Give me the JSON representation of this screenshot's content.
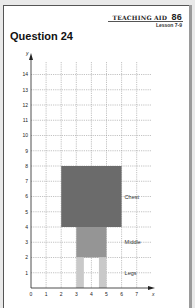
{
  "header": {
    "title": "Teaching Aid",
    "number": "86",
    "lesson": "Lesson 7-9"
  },
  "question": {
    "title": "Question 24"
  },
  "chart_data": {
    "type": "diagram",
    "title": "Question 24",
    "xlabel": "x",
    "ylabel": "y",
    "xlim": [
      0,
      8
    ],
    "ylim": [
      0,
      15
    ],
    "x_ticks": [
      "0",
      "1",
      "2",
      "3",
      "4",
      "5",
      "6",
      "7"
    ],
    "y_ticks": [
      "1",
      "2",
      "3",
      "4",
      "5",
      "6",
      "7",
      "8",
      "9",
      "10",
      "11",
      "12",
      "13",
      "14"
    ],
    "grid": true,
    "shapes": [
      {
        "name": "Chest",
        "x0": 2,
        "x1": 6,
        "y0": 4,
        "y1": 8,
        "color": "#6b6b6b"
      },
      {
        "name": "Middle",
        "x0": 3,
        "x1": 5,
        "y0": 2,
        "y1": 4,
        "color": "#959595"
      },
      {
        "name": "Leg (left)",
        "x0": 3,
        "x1": 3.5,
        "y0": 0,
        "y1": 2,
        "color": "#c9c9c9"
      },
      {
        "name": "Leg (right)",
        "x0": 4.5,
        "x1": 5,
        "y0": 0,
        "y1": 2,
        "color": "#c9c9c9"
      }
    ],
    "labels": [
      {
        "text": "Chest",
        "x": 6.2,
        "y": 6
      },
      {
        "text": "Middle",
        "x": 6.2,
        "y": 3
      },
      {
        "text": "Legs",
        "x": 6.2,
        "y": 1
      }
    ]
  }
}
